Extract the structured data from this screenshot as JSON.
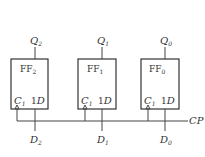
{
  "diagram": {
    "type": "register-of-d-flip-flops",
    "clock_label": "CP",
    "flip_flops": [
      {
        "name": "FF",
        "index": "2",
        "q": "Q",
        "q_sub": "2",
        "d": "D",
        "d_sub": "2",
        "clk_pin": "C",
        "clk_sub": "1",
        "d_pin_prefix": "1",
        "d_pin": "D"
      },
      {
        "name": "FF",
        "index": "1",
        "q": "Q",
        "q_sub": "1",
        "d": "D",
        "d_sub": "1",
        "clk_pin": "C",
        "clk_sub": "1",
        "d_pin_prefix": "1",
        "d_pin": "D"
      },
      {
        "name": "FF",
        "index": "0",
        "q": "Q",
        "q_sub": "0",
        "d": "D",
        "d_sub": "0",
        "clk_pin": "C",
        "clk_sub": "1",
        "d_pin_prefix": "1",
        "d_pin": "D"
      }
    ]
  }
}
